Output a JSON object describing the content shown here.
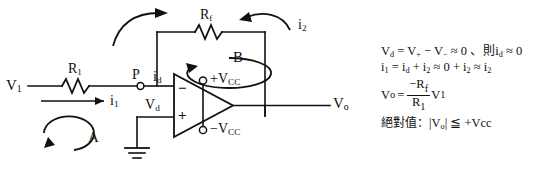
{
  "diagram": {
    "title_present": false,
    "labels": {
      "v_in": "V1",
      "v_in_sub": "1",
      "r1": "R",
      "r1_sub": "1",
      "rf": "R",
      "rf_sub": "f",
      "node_p": "P",
      "i1": "i",
      "i1_sub": "1",
      "i2": "i",
      "i2_sub": "2",
      "id": "i",
      "id_sub": "d",
      "vd": "V",
      "vd_sub": "d",
      "loop_a": "A",
      "loop_b": "B",
      "vcc_pos": "+V",
      "vcc_pos_sub": "CC",
      "vcc_neg": "−V",
      "vcc_neg_sub": "CC",
      "v_out": "V",
      "v_out_sub": "o",
      "opamp_minus": "−",
      "opamp_plus": "+"
    },
    "colors": {
      "line": "#111111",
      "text": "#111111",
      "background": "#ffffff"
    }
  },
  "equations": {
    "line1": {
      "lhs": "V",
      "lhs_sub": "d",
      "text_a": " = V",
      "sub_plus": "+",
      "text_b": " − V",
      "sub_minus": "−",
      "text_c": " ≈ 0 、",
      "cjk": "則",
      "text_d": "i",
      "sub_d": "d",
      "text_e": " ≈ 0",
      "full": "Vd = V+ − V− ≈ 0 、則 id ≈ 0"
    },
    "line2": {
      "full": "i1 = id + i2 ≈ 0 + i2 ≈ i2",
      "lhs": "i",
      "lhs_sub": "1",
      "t1": " = i",
      "s1": "d",
      "t2": " + i",
      "s2": "2",
      "t3": " ≈ 0 + i",
      "s3": "2",
      "t4": " ≈ i",
      "s4": "2"
    },
    "line3": {
      "lhs": "V",
      "lhs_sub": "o",
      "eq": "=",
      "numerator": "−R",
      "numerator_sub": "f",
      "denominator": "R",
      "denominator_sub": "1",
      "trailing": "V",
      "trailing_sub": "1",
      "full": "Vo = (−Rf / R1) V1"
    },
    "line4": {
      "cjk_prefix": "絕對值：",
      "math": "|V",
      "math_sub": "o",
      "math_tail": "| ≦ +Vcc",
      "full": "絕對值：|Vo| ≦ +Vcc"
    }
  }
}
